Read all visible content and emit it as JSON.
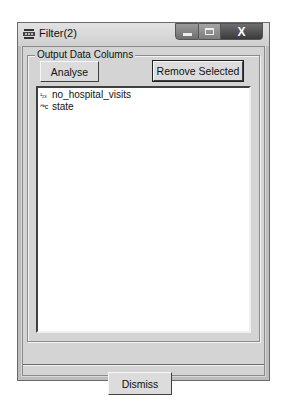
{
  "window": {
    "title": "Filter(2)",
    "icon": "filter-app-icon",
    "controls": {
      "minimize": "minimize-icon",
      "maximize": "maximize-icon",
      "close": "X"
    }
  },
  "group": {
    "label": "Output Data Columns",
    "buttons": {
      "analyse": "Analyse",
      "remove_selected": "Remove Selected"
    },
    "columns": [
      {
        "type_icon": "integer-type-icon",
        "type_glyph": "¹₂₃",
        "name": "no_hospital_visits"
      },
      {
        "type_icon": "string-type-icon",
        "type_glyph": "ᴬᵇc",
        "name": "state"
      }
    ]
  },
  "footer": {
    "dismiss": "Dismiss"
  }
}
